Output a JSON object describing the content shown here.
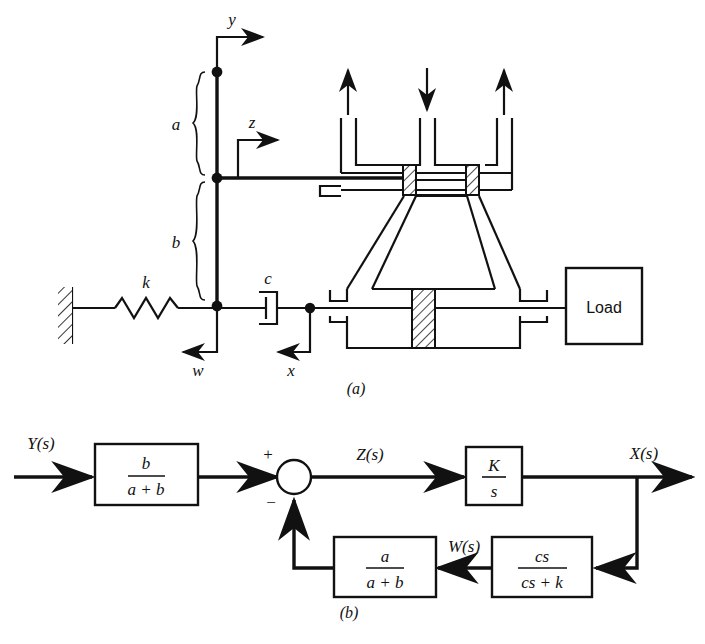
{
  "figure": {
    "panel_a": {
      "caption": "(a)",
      "labels": {
        "y_arrow": "y",
        "z_arrow": "z",
        "w_arrow": "w",
        "x_arrow": "x",
        "link_upper": "a",
        "link_lower": "b",
        "spring": "k",
        "damper": "c",
        "load_block": "Load"
      },
      "icons": {
        "wall": "hatched-wall-icon",
        "spring": "spring-coil-icon",
        "damper": "dashpot-icon",
        "valve_spool": "spool-valve-icon",
        "power_cylinder": "hydraulic-cylinder-icon",
        "port_return_left": "return-flow-arrow-up-icon",
        "port_supply": "supply-flow-arrow-down-icon",
        "port_return_right": "return-flow-arrow-up-icon",
        "pivot": "pivot-joint-icon"
      }
    },
    "panel_b": {
      "caption": "(b)",
      "signals": {
        "input": "Y(s)",
        "error": "Z(s)",
        "output": "X(s)",
        "feedback": "W(s)"
      },
      "summing_junction": {
        "plus": "+",
        "minus": "−"
      },
      "blocks": [
        {
          "name": "input-gain",
          "numerator": "b",
          "denominator": "a + b"
        },
        {
          "name": "integrator",
          "numerator": "K",
          "denominator": "s"
        },
        {
          "name": "feedback-gain",
          "numerator": "a",
          "denominator": "a + b"
        },
        {
          "name": "damper-spring-lag",
          "numerator": "cs",
          "denominator": "cs + k"
        }
      ]
    }
  }
}
